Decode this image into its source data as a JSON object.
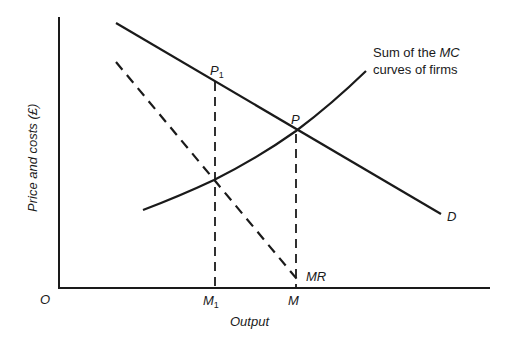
{
  "diagram": {
    "axes": {
      "y_label": "Price and costs (£)",
      "x_label": "Output",
      "origin_label": "O"
    },
    "curves": {
      "demand": {
        "label": "D",
        "style": "solid"
      },
      "marginal_revenue": {
        "label": "MR",
        "style": "dashed"
      },
      "marginal_cost": {
        "label_line1_prefix": "Sum of the ",
        "label_line1_em": "MC",
        "label_line2": "curves of firms",
        "style": "solid"
      }
    },
    "points": {
      "p1": {
        "main": "P",
        "sub": "1"
      },
      "p": {
        "main": "P"
      }
    },
    "x_ticks": {
      "m1": {
        "main": "M",
        "sub": "1"
      },
      "m": {
        "main": "M"
      }
    },
    "colors": {
      "line": "#1a1a1a",
      "background": "#ffffff"
    }
  }
}
